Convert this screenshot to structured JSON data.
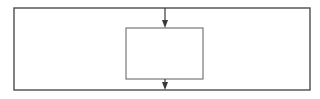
{
  "figure": {
    "title": "",
    "caption": "",
    "background_color": "#ffffff",
    "width": 320,
    "height": 99
  },
  "chart_data": {
    "type": "diagram",
    "title": "",
    "xlabel": "",
    "ylabel": "",
    "grid": false,
    "legend": null,
    "annotations": [],
    "shapes": [
      {
        "name": "outer-rectangle",
        "kind": "rectangle",
        "label": "",
        "x": 14,
        "y": 8,
        "width": 296,
        "height": 82,
        "stroke_color": "#4d4d4d",
        "stroke_width": 1.4,
        "fill": "none"
      },
      {
        "name": "inner-rectangle",
        "kind": "rectangle",
        "label": "",
        "x": 126,
        "y": 28,
        "width": 77,
        "height": 51,
        "stroke_color": "#6b6b6b",
        "stroke_width": 1.1,
        "fill": "none"
      },
      {
        "name": "top-arrow",
        "kind": "arrow",
        "label": "",
        "direction": "down",
        "x": 165,
        "y_start": 8,
        "y_end": 28,
        "stroke_color": "#3a3a3a",
        "stroke_width": 1.2,
        "head_width": 6,
        "head_length": 8
      },
      {
        "name": "bottom-arrow",
        "kind": "arrow",
        "label": "",
        "direction": "down",
        "x": 165,
        "y_start": 79,
        "y_end": 90,
        "stroke_color": "#3a3a3a",
        "stroke_width": 1.2,
        "head_width": 6,
        "head_length": 8
      }
    ]
  }
}
